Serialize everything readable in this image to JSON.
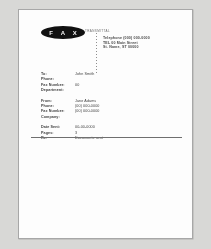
{
  "document": {
    "kind": "fax-cover-sheet",
    "logo": {
      "text": "F A X",
      "caption": "TRANSMITTAL"
    },
    "sender_address": [
      "Telephone (000) 000-0000",
      "TEL 00 Main Street",
      "St. Name, ST 00000"
    ],
    "groups": [
      {
        "name": "recipient",
        "rows": [
          {
            "label": "To:",
            "value": "John Smith"
          },
          {
            "label": "Phone:",
            "value": ""
          },
          {
            "label": "Fax Number:",
            "value": "00"
          },
          {
            "label": "Department:",
            "value": ""
          }
        ]
      },
      {
        "name": "sender",
        "rows": [
          {
            "label": "From:",
            "value": "Jane Adams"
          },
          {
            "label": "Phone:",
            "value": "(00) 000-0000"
          },
          {
            "label": "Fax Number:",
            "value": "(00) 000-0000"
          },
          {
            "label": "Company:",
            "value": ""
          }
        ]
      },
      {
        "name": "transmission",
        "rows": [
          {
            "label": "Date Sent:",
            "value": "00-00-0000"
          },
          {
            "label": "Pages:",
            "value": "3"
          },
          {
            "label": "Re:",
            "value": "Documents sent"
          }
        ]
      }
    ],
    "colors": {
      "scan_background": "#d8d8d6",
      "page": "#fdfdfd",
      "page_border": "#a7a7a7",
      "logo_fill": "#111111",
      "logo_text": "#f4f4f4",
      "rule": "#6f6f6f",
      "text": "#3d3d3d"
    }
  }
}
